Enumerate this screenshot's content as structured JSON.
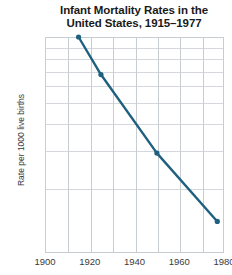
{
  "chart_data": {
    "type": "line",
    "title": "Infant Mortality Rates in the United States, 1915–1977",
    "title_lines": [
      "Infant Mortality Rates in the",
      "United States, 1915–1977"
    ],
    "xlabel": "",
    "ylabel": "Rate per 1000 live births",
    "yscale": "log",
    "xlim": [
      1900,
      1980
    ],
    "ylim": [
      10,
      100
    ],
    "grid": true,
    "legend": null,
    "x": [
      1915,
      1925,
      1950,
      1977
    ],
    "values": [
      100,
      67,
      29,
      14
    ],
    "series": [
      {
        "name": "Infant mortality rate",
        "color": "#1f6080",
        "marker": "circle",
        "points": [
          {
            "x": 1915,
            "y": 100
          },
          {
            "x": 1925,
            "y": 67
          },
          {
            "x": 1950,
            "y": 29
          },
          {
            "x": 1977,
            "y": 14
          }
        ]
      }
    ],
    "ytick_labels": [
      "100",
      "90",
      "80",
      "70",
      "60",
      "50",
      "40",
      "30",
      "20",
      "10"
    ],
    "ytick_values": [
      100,
      90,
      80,
      70,
      60,
      50,
      40,
      30,
      20,
      10
    ],
    "xtick_labels": [
      "1900",
      "1920",
      "1940",
      "1960",
      "1980"
    ],
    "xtick_values": [
      1900,
      1920,
      1940,
      1960,
      1980
    ],
    "xminor_values": [
      1910,
      1930,
      1950,
      1970
    ],
    "colors": {
      "line": "#1f6080",
      "grid": "#d4d8dc",
      "axis": "#c8cdd2",
      "text": "#3a3a3a",
      "title": "#1a1a1a",
      "background": "#ffffff"
    }
  }
}
